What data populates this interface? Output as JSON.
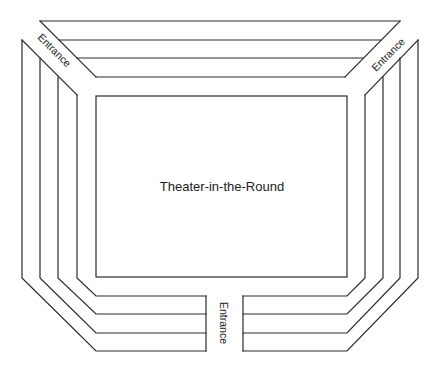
{
  "diagram": {
    "stage_label": "Theater-in-the-Round",
    "entrances": [
      {
        "id": "top-left",
        "label": "Entrance"
      },
      {
        "id": "top-right",
        "label": "Entrance"
      },
      {
        "id": "bottom",
        "label": "Entrance"
      }
    ],
    "seating_sections": [
      {
        "id": "top",
        "rows": 4
      },
      {
        "id": "left",
        "rows": 4
      },
      {
        "id": "right",
        "rows": 4
      },
      {
        "id": "bottom-left",
        "rows": 4
      },
      {
        "id": "bottom-right",
        "rows": 4
      }
    ],
    "colors": {
      "line": "#2a2a2a",
      "background": "#ffffff",
      "text": "#222222"
    }
  }
}
